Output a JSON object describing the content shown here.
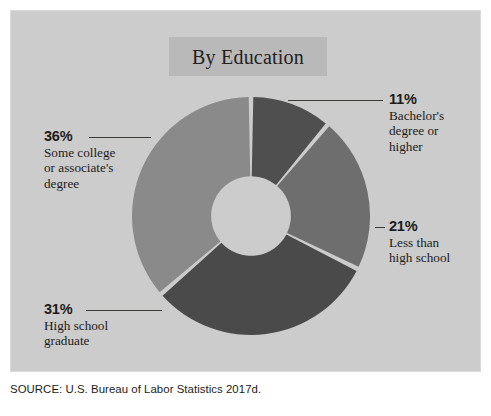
{
  "panel": {
    "background_color": "#cccccc",
    "page_background_color": "#ffffff"
  },
  "title": {
    "text": "By Education",
    "box_color": "#b9b9b9",
    "text_color": "#23201e"
  },
  "source": {
    "text": "SOURCE: U.S. Bureau of Labor Statistics 2017d."
  },
  "labels": {
    "bachelors": {
      "pct": "11%",
      "desc": "Bachelor's\ndegree or\nhigher"
    },
    "lessthan": {
      "pct": "21%",
      "desc": "Less than\nhigh school"
    },
    "somecollege": {
      "pct": "36%",
      "desc": "Some college\nor associate's\ndegree"
    },
    "highschool": {
      "pct": "31%",
      "desc": "High school\ngraduate"
    }
  },
  "chart_data": {
    "type": "pie",
    "variant": "donut",
    "title": "By Education",
    "source": "SOURCE: U.S. Bureau of Labor Statistics 2017d.",
    "unit": "percent",
    "start_angle_deg": 0,
    "direction": "clockwise",
    "inner_radius_ratio": 0.335,
    "gap_deg": 2.2,
    "legend": "none (direct labels with leader lines)",
    "categories": [
      "Bachelor's degree or higher",
      "Less than high school",
      "High school graduate",
      "Some college or associate's degree"
    ],
    "values": [
      11,
      21,
      31,
      36
    ],
    "labels": [
      "11%",
      "21%",
      "31%",
      "36%"
    ],
    "colors": [
      "#4f4f4f",
      "#6e6e6e",
      "#4a4a4a",
      "#8a8a8a"
    ],
    "slices": [
      {
        "category": "Bachelor's degree or higher",
        "value": 11,
        "label": "11%",
        "color": "#4f4f4f"
      },
      {
        "category": "Less than high school",
        "value": 21,
        "label": "21%",
        "color": "#6e6e6e"
      },
      {
        "category": "High school graduate",
        "value": 31,
        "label": "31%",
        "color": "#4a4a4a"
      },
      {
        "category": "Some college or associate's degree",
        "value": 36,
        "label": "36%",
        "color": "#8a8a8a"
      }
    ]
  }
}
